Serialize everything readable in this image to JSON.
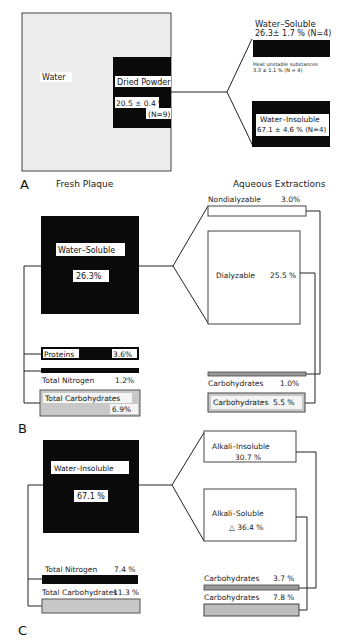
{
  "panels": {
    "A": {
      "letter": "A",
      "left_caption": "Fresh Plaque",
      "right_caption": "Aqueous Extractions",
      "water_label": "Water",
      "dried_powder": {
        "label": "Dried Powder",
        "value": "20.5 ± 0.4 %",
        "n": "(N=9)"
      },
      "water_soluble": {
        "label": "Water–Soluble",
        "value": "26.3± 1.7 % (N=4)"
      },
      "heat_unstable": {
        "label": "Heat unstable substances",
        "value": "3.3 ± 1.1 % (N = 4)"
      },
      "water_insoluble": {
        "label": "Water–Insoluble",
        "value": "67.1 ± 4.6 % (N=4)"
      }
    },
    "B": {
      "letter": "B",
      "main": {
        "label": "Water–Soluble",
        "value": "26.3%"
      },
      "proteins": {
        "label": "Proteins",
        "value": "3.6%"
      },
      "total_nitrogen": {
        "label": "Total Nitrogen",
        "value": "1.2%"
      },
      "total_carbohydrates": {
        "label": "Total Carbohydrates",
        "value": "6.9%"
      },
      "nondialyzable": {
        "label": "Nondialyzable",
        "value": "3.0%"
      },
      "dialyzable": {
        "label": "Dialyzable",
        "value": "25.5 %"
      },
      "carb_nondialyzable": {
        "label": "Carbohydrates",
        "value": "1.0%"
      },
      "carb_dialyzable": {
        "label": "Carbohydrates",
        "value": "5.5 %"
      }
    },
    "C": {
      "letter": "C",
      "main": {
        "label": "Water–Insoluble",
        "value": "67.1 %"
      },
      "total_nitrogen": {
        "label": "Total Nitrogen",
        "value": "7.4 %"
      },
      "total_carbohydrates": {
        "label": "Total Carbohydrates",
        "value": "11.3 %"
      },
      "alkali_insoluble": {
        "label": "Alkali–Insoluble",
        "value": "30.7 %"
      },
      "alkali_soluble": {
        "label": "Alkali–Soluble",
        "value": "△ 36.4 %"
      },
      "carb_alkali_insoluble": {
        "label": "Carbohydrates",
        "value": "3.7 %"
      },
      "carb_alkali_soluble": {
        "label": "Carbohydrates",
        "value": "7.8 %"
      }
    }
  },
  "colors": {
    "black_box": "#0a0a0a",
    "gray_fill": "#c8c8c8",
    "light_panel": "#ececec",
    "line": "#222222"
  }
}
